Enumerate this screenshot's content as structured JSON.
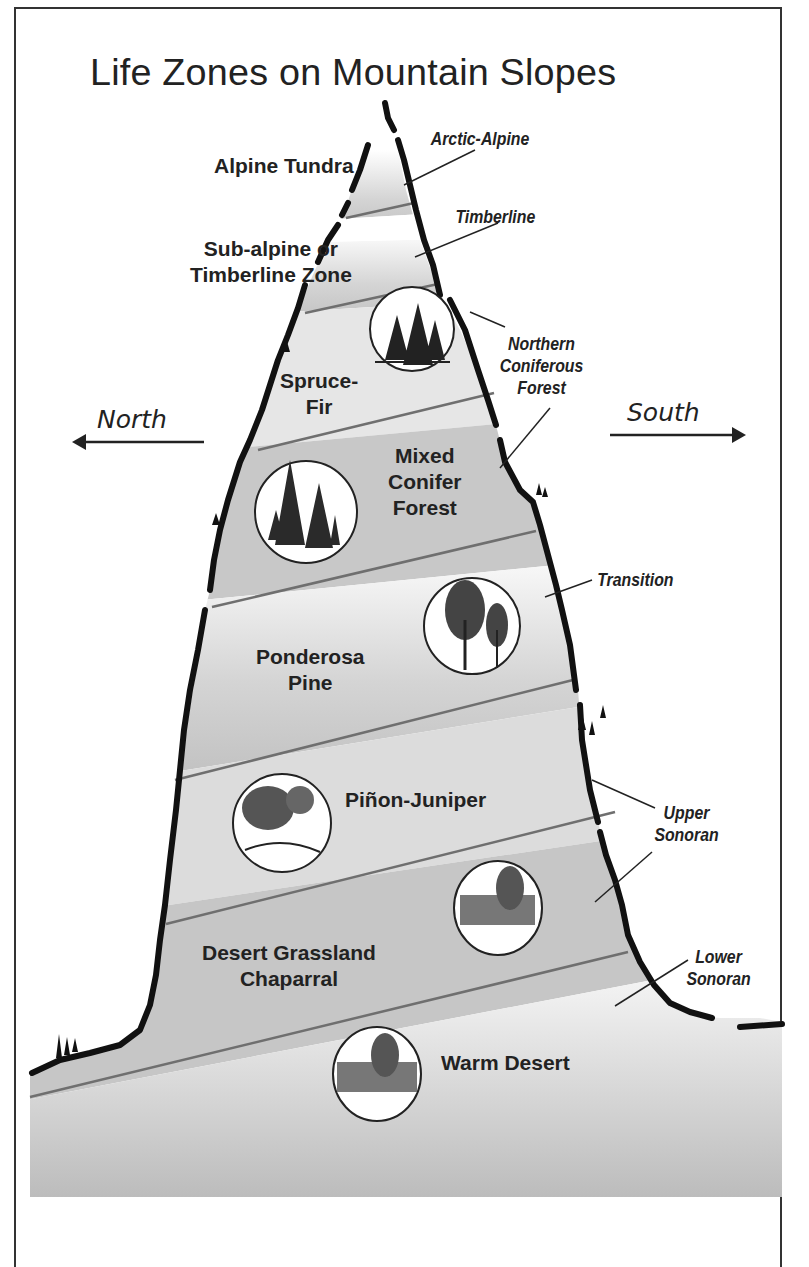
{
  "title": "Life Zones on Mountain Slopes",
  "directions": {
    "north": "North",
    "south": "South"
  },
  "zones": [
    {
      "label": "Alpine Tundra"
    },
    {
      "label_line1": "Sub-alpine or",
      "label_line2": "Timberline Zone"
    },
    {
      "label_line1": "Spruce-",
      "label_line2": "Fir"
    },
    {
      "label_line1": "Mixed",
      "label_line2": "Conifer",
      "label_line3": "Forest"
    },
    {
      "label_line1": "Ponderosa",
      "label_line2": "Pine"
    },
    {
      "label": "Piñon-Juniper"
    },
    {
      "label_line1": "Desert Grassland",
      "label_line2": "Chaparral"
    },
    {
      "label": "Warm Desert"
    }
  ],
  "belts": [
    {
      "label": "Arctic-Alpine"
    },
    {
      "label": "Timberline"
    },
    {
      "label_line1": "Northern",
      "label_line2": "Coniferous",
      "label_line3": "Forest"
    },
    {
      "label": "Transition"
    },
    {
      "label_line1": "Upper",
      "label_line2": "Sonoran"
    },
    {
      "label_line1": "Lower",
      "label_line2": "Sonoran"
    }
  ],
  "illustrations": [
    {
      "icon": "spruce-fir-trees-icon"
    },
    {
      "icon": "mixed-conifer-trees-icon"
    },
    {
      "icon": "ponderosa-pine-trees-icon"
    },
    {
      "icon": "pinon-juniper-trees-icon"
    },
    {
      "icon": "desert-grassland-shrub-icon"
    },
    {
      "icon": "warm-desert-shrub-icon"
    }
  ],
  "colors": {
    "zone_gray": "#c4c4c4",
    "outline": "#1a1a1a",
    "text": "#222222"
  }
}
